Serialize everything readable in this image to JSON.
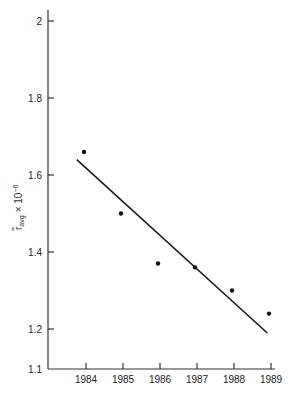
{
  "chart_data": {
    "type": "scatter",
    "title": "",
    "xlabel": "",
    "ylabel": "r̃ avg × 10⁻⁶",
    "ylabel_main": "r̃",
    "ylabel_sub": "avg",
    "ylabel_tail": "× 10",
    "ylabel_exp": "−6",
    "x": [
      1984,
      1985,
      1986,
      1987,
      1988,
      1989
    ],
    "values": [
      1.66,
      1.5,
      1.37,
      1.36,
      1.3,
      1.24
    ],
    "series": [
      {
        "name": "observed",
        "type": "scatter",
        "x": [
          1984,
          1985,
          1986,
          1987,
          1988,
          1989
        ],
        "values": [
          1.66,
          1.5,
          1.37,
          1.36,
          1.3,
          1.24
        ]
      },
      {
        "name": "fit",
        "type": "line",
        "x": [
          1983.75,
          1988.9
        ],
        "values": [
          1.64,
          1.19
        ]
      }
    ],
    "xticks": [
      "1984",
      "1985",
      "1986",
      "1987",
      "1988",
      "1989"
    ],
    "yticks": [
      "1.1",
      "1.2",
      "1.4",
      "1.6",
      "1.8",
      "2"
    ],
    "xlim": [
      1983,
      1989.2
    ],
    "ylim": [
      1.1,
      2.0
    ],
    "grid": false,
    "legend": null
  }
}
